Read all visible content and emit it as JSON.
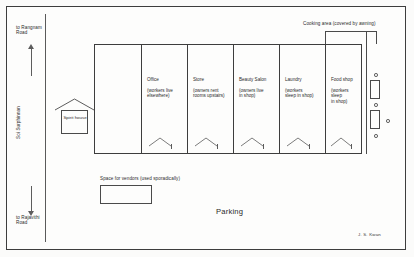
{
  "drawing": {
    "title": "Shophouse block plan",
    "signature": "J. S. Kwan"
  },
  "roads": {
    "top_label": "to Rangnam\nRoad",
    "bottom_label": "to Rajavithi\nRoad",
    "soi_label": "Soi Surphinnan"
  },
  "features": {
    "spirit_house": "Spirit\nhouse",
    "elevator": "Elevator",
    "cooking_area": "Cooking area (covered by awning)",
    "vendor_space": "Space for vendors (used sporadically)",
    "parking": "Parking"
  },
  "units": [
    {
      "name": "Office",
      "note": "(workers live\nelsewhere)"
    },
    {
      "name": "Store",
      "note": "(owners rent\nrooms upstairs)"
    },
    {
      "name": "Beauty Salon",
      "note": "(owners live\nin shop)"
    },
    {
      "name": "Laundry",
      "note": "(workers\nsleep in shop)"
    },
    {
      "name": "Food shop",
      "note": "(workers sleep\nin shop)"
    }
  ],
  "colors": {
    "ink": "#3d3d3d",
    "paper": "#fdfdfc",
    "text": "#2b2b2b"
  }
}
